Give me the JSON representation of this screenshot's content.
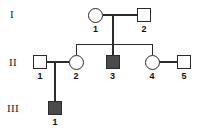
{
  "figure": {
    "type": "pedigree-chart",
    "width": 211,
    "height": 132,
    "background_color": "#ffffff",
    "line_color": "#2b2b2b",
    "affected_fill_color": "#4a4a4a",
    "unaffected_fill_color": "#ffffff"
  },
  "generations": [
    {
      "label": "I"
    },
    {
      "label": "II"
    },
    {
      "label": "III"
    }
  ],
  "individuals": [
    {
      "id": "I-1",
      "number": "1",
      "sex": "female",
      "shape": "circle",
      "affected": false
    },
    {
      "id": "I-2",
      "number": "2",
      "sex": "male",
      "shape": "square",
      "affected": false
    },
    {
      "id": "II-1",
      "number": "1",
      "sex": "male",
      "shape": "square",
      "affected": false
    },
    {
      "id": "II-2",
      "number": "2",
      "sex": "female",
      "shape": "circle",
      "affected": false
    },
    {
      "id": "II-3",
      "number": "3",
      "sex": "male",
      "shape": "square",
      "affected": true
    },
    {
      "id": "II-4",
      "number": "4",
      "sex": "female",
      "shape": "circle",
      "affected": false
    },
    {
      "id": "II-5",
      "number": "5",
      "sex": "male",
      "shape": "square",
      "affected": false
    },
    {
      "id": "III-1",
      "number": "1",
      "sex": "male",
      "shape": "square",
      "affected": true
    }
  ]
}
